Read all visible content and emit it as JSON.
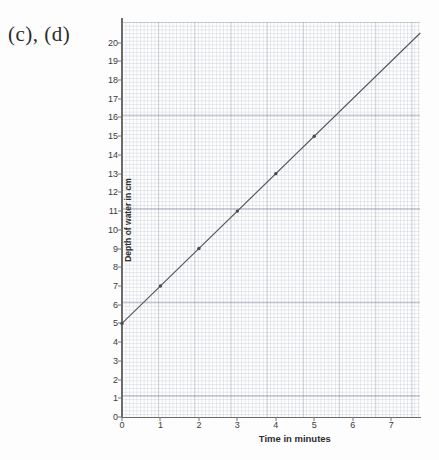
{
  "figure_label": "(c), (d)",
  "chart_data": {
    "type": "line",
    "title": "",
    "xlabel": "Time in minutes",
    "ylabel": "Depth of water in cm",
    "xlim": [
      0,
      7.75
    ],
    "ylim": [
      0,
      21.1
    ],
    "grid": true,
    "grid_style": "graph-paper",
    "legend": "none",
    "xticks": [
      0,
      1,
      2,
      3,
      4,
      5,
      6,
      7
    ],
    "xtick_labels": [
      "0",
      "1",
      "2",
      "3",
      "4",
      "5",
      "6",
      "7"
    ],
    "yticks": [
      0,
      1,
      2,
      3,
      4,
      5,
      6,
      7,
      8,
      9,
      10,
      11,
      12,
      13,
      14,
      15,
      16,
      17,
      18,
      19,
      20
    ],
    "ytick_labels": [
      "0",
      "1",
      "2",
      "3",
      "4",
      "5",
      "6",
      "7",
      "8",
      "9",
      "10",
      "11",
      "12",
      "13",
      "14",
      "15",
      "16",
      "17",
      "18",
      "19",
      "20"
    ],
    "line": {
      "intercept": 5,
      "slope": 2,
      "x_start": 0,
      "x_end": 7.75,
      "y_start": 5,
      "y_end": 20.5,
      "color": "#55555d",
      "width": 1.1
    },
    "series": [
      {
        "name": "Depth of water",
        "x": [
          0,
          1,
          2,
          3,
          4,
          5
        ],
        "values": [
          5,
          7,
          9,
          11,
          13,
          15
        ],
        "marker": "dot",
        "marker_color": "#4a4a52"
      }
    ]
  },
  "colors": {
    "grid": "#78829633",
    "axis": "#6b6b6b",
    "line": "#55555d",
    "text": "#2e2e2e",
    "page": "#fdfdfd"
  }
}
